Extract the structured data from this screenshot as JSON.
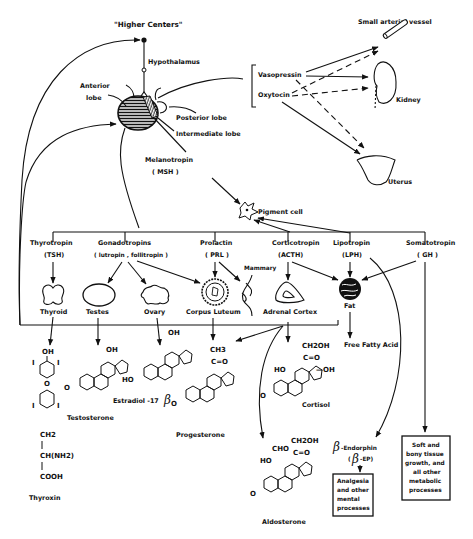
{
  "top": {
    "higher_centers": "\"Higher Centers\"",
    "hypothalamus": "Hypothalamus",
    "anterior_lobe_1": "Anterior",
    "anterior_lobe_2": "lobe",
    "posterior_lobe": "Posterior  lobe",
    "intermediate_lobe": "Intermediate lobe",
    "melanotropin": "Melanotropin",
    "msh": "( MSH )"
  },
  "posterior_hormones": {
    "vasopressin": "Vasopressin",
    "oxytocin": "Oxytocin",
    "small_arterial_vessel": "Small arterial vessel",
    "kidney": "Kidney",
    "uterus": "Uterus"
  },
  "pigment_cell": "Pigment cell",
  "hormones": [
    {
      "name": "Thyrotropin",
      "abbr": "(TSH)"
    },
    {
      "name": "Gonadotropins",
      "abbr": "( lutropin , follitropin )"
    },
    {
      "name": "Prolactin",
      "abbr": "( PRL )"
    },
    {
      "name": "Corticotropin",
      "abbr": "(ACTH)"
    },
    {
      "name": "Lipotropin",
      "abbr": "(LPH)"
    },
    {
      "name": "Somatotropin",
      "abbr": "( GH )"
    }
  ],
  "targets": {
    "thyroid": "Thyroid",
    "testes": "Testes",
    "ovary": "Ovary",
    "corpus_luteum": "Corpus Luteum",
    "mammary": "Mammary",
    "adrenal_cortex": "Adrenal Cortex",
    "fat": "Fat",
    "free_fatty_acid": "Free Fatty Acid"
  },
  "products": {
    "thyroxin": "Thyroxin",
    "testosterone": "Testosterone",
    "estradiol": "Estradiol  -17",
    "progesterone": "Progesterone",
    "cortisol": "Cortisol",
    "aldosterone": "Aldosterone",
    "beta_endorphin": "-Endorphin",
    "beta_ep_open": "(",
    "beta_ep": "-EP)",
    "beta_symbol": "β"
  },
  "chem_labels": {
    "oh": "OH",
    "ho": "HO",
    "i": "I",
    "o": "O",
    "ch2": "CH2",
    "ch_nh2": "CH(NH2)",
    "cooh": "COOH",
    "ch3": "CH3",
    "c_eq_o": "C=O",
    "ch2oh": "CH2OH",
    "minus_oh": "—OH",
    "cho": "CHO",
    "bar": "|"
  },
  "boxes": {
    "analgesia": [
      "Analgesia",
      "and other",
      "mental",
      "processes"
    ],
    "soft_tissue": [
      "Soft and",
      "bony tissue",
      "growth, and",
      "all other",
      "metabolic",
      "processes"
    ]
  }
}
